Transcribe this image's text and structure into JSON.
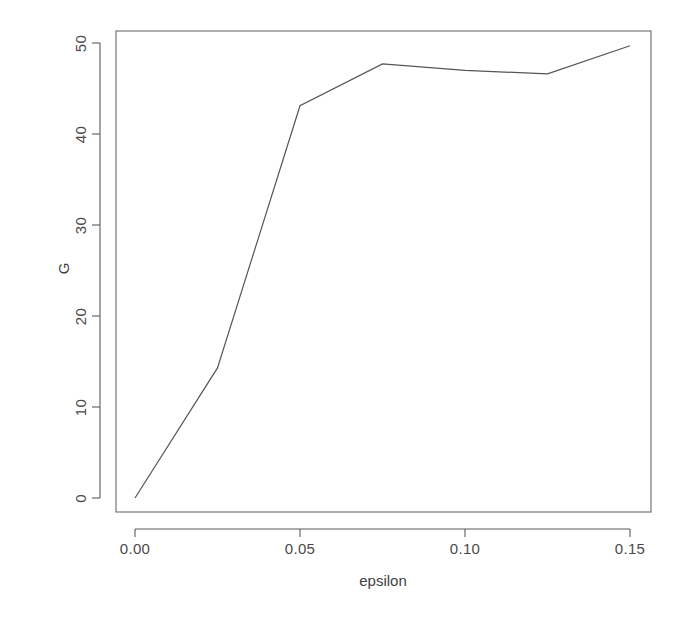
{
  "chart_data": {
    "type": "line",
    "title": "",
    "xlabel": "epsilon",
    "ylabel": "G",
    "xlim": [
      -0.0045,
      0.1565
    ],
    "ylim": [
      -1.55,
      51.3
    ],
    "grid": false,
    "legend": null,
    "x": [
      0.0,
      0.025,
      0.05,
      0.075,
      0.1,
      0.125,
      0.15
    ],
    "values": [
      0.0,
      14.3,
      43.1,
      47.7,
      47.0,
      46.6,
      49.7
    ],
    "series": [
      {
        "name": "G",
        "color": "#555555",
        "x": [
          0.0,
          0.025,
          0.05,
          0.075,
          0.1,
          0.125,
          0.15
        ],
        "values": [
          0.0,
          14.3,
          43.1,
          47.7,
          47.0,
          46.6,
          49.7
        ]
      }
    ],
    "xticks": [
      0.0,
      0.05,
      0.1,
      0.15
    ],
    "xtick_labels": [
      "0.00",
      "0.05",
      "0.10",
      "0.15"
    ],
    "yticks": [
      0,
      10,
      20,
      30,
      40,
      50
    ],
    "ytick_labels": [
      "0",
      "10",
      "20",
      "30",
      "40",
      "50"
    ]
  },
  "axes": {
    "x_title": "epsilon",
    "y_title": "G"
  },
  "style": {
    "line_color": "#555555",
    "axis_color": "#555555",
    "box_color": "#666666",
    "background": "#ffffff"
  }
}
